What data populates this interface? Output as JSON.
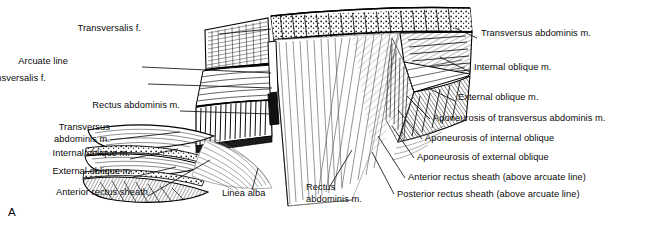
{
  "figure": {
    "panel_letter": "A",
    "background": "#ffffff",
    "ink": "#000000",
    "labels_left": [
      {
        "id": "transversalis-f-top",
        "text": "Transversalis f.",
        "x": 141,
        "y": 29,
        "align": "right",
        "leader": [
          [
            219,
            34
          ],
          [
            271,
            29
          ]
        ]
      },
      {
        "id": "arcuate-line",
        "text": "Arcuate line",
        "x": 68,
        "y": 62,
        "align": "right",
        "leader": [
          [
            142,
            67
          ],
          [
            271,
            73
          ]
        ]
      },
      {
        "id": "transversalis-f-mid",
        "text": "Transversalis f.",
        "x": 46,
        "y": 79,
        "align": "right",
        "leader": [
          [
            148,
            84
          ],
          [
            272,
            88
          ]
        ]
      },
      {
        "id": "rectus-abdominis-m-left",
        "text": "Rectus abdominis m.",
        "x": 46,
        "y": 106,
        "align": "right",
        "leader": [
          [
            180,
            111
          ],
          [
            272,
            114
          ]
        ]
      },
      {
        "id": "transversus-abdominis-m-left",
        "text": "Transversus\nabdominis m.",
        "x": 22,
        "y": 128,
        "align": "right",
        "leader": [
          [
            110,
            140
          ],
          [
            180,
            132
          ]
        ]
      },
      {
        "id": "internal-oblique-m-left",
        "text": "Internal oblique m.",
        "x": 22,
        "y": 154,
        "align": "right",
        "leader": [
          [
            130,
            159
          ],
          [
            178,
            149
          ]
        ]
      },
      {
        "id": "external-oblique-m-left",
        "text": "External oblique m.",
        "x": 22,
        "y": 172,
        "align": "right",
        "leader": [
          [
            133,
            177
          ],
          [
            176,
            167
          ]
        ]
      },
      {
        "id": "anterior-rectus-sheath-left",
        "text": "Anterior rectus sheath",
        "x": 22,
        "y": 193,
        "align": "right",
        "leader": [
          [
            148,
            196
          ],
          [
            210,
            160
          ]
        ]
      }
    ],
    "labels_center": [
      {
        "id": "linea-alba",
        "text": "Linea alba",
        "x": 225,
        "y": 194,
        "align": "left",
        "leader": [
          [
            252,
            190
          ],
          [
            258,
            168
          ]
        ]
      },
      {
        "id": "rectus-abdominis-m-center",
        "text": "Rectus\nabdominis m.",
        "x": 308,
        "y": 188,
        "align": "left",
        "leader": [
          [
            330,
            186
          ],
          [
            352,
            150
          ]
        ]
      }
    ],
    "labels_right": [
      {
        "id": "transversus-abdominis-m-right",
        "text": "Transversus abdominis m.",
        "x": 481,
        "y": 34,
        "align": "left",
        "leader": [
          [
            477,
            38
          ],
          [
            455,
            28
          ]
        ]
      },
      {
        "id": "internal-oblique-m-right",
        "text": "Internal oblique m.",
        "x": 474,
        "y": 68,
        "align": "left",
        "leader": [
          [
            470,
            72
          ],
          [
            440,
            57
          ]
        ]
      },
      {
        "id": "external-oblique-m-right",
        "text": "External oblique m.",
        "x": 458,
        "y": 98,
        "align": "left",
        "leader": [
          [
            455,
            101
          ],
          [
            428,
            88
          ]
        ]
      },
      {
        "id": "aponeurosis-of-transversus-abdominis-m",
        "text": "Aponeurosis of transversus abdominis m.",
        "x": 433,
        "y": 119,
        "align": "left",
        "leader": [
          [
            430,
            119
          ],
          [
            407,
            96
          ]
        ]
      },
      {
        "id": "aponeurosis-of-internal-oblique",
        "text": "Aponeurosis of internal oblique",
        "x": 425,
        "y": 139,
        "align": "left",
        "leader": [
          [
            422,
            139
          ],
          [
            398,
            110
          ]
        ]
      },
      {
        "id": "aponeurosis-of-external-oblique",
        "text": "Aponeurosis of external oblique",
        "x": 417,
        "y": 158,
        "align": "left",
        "leader": [
          [
            414,
            158
          ],
          [
            392,
            126
          ]
        ]
      },
      {
        "id": "anterior-rectus-sheath-above-arcuate-line",
        "text": "Anterior rectus sheath (above arcuate line)",
        "x": 408,
        "y": 178,
        "align": "left",
        "leader": [
          [
            405,
            178
          ],
          [
            378,
            136
          ]
        ]
      },
      {
        "id": "posterior-rectus-sheath-above-arcuate-line",
        "text": "Posterior rectus sheath (above arcuate line)",
        "x": 397,
        "y": 195,
        "align": "left",
        "leader": [
          [
            394,
            194
          ],
          [
            372,
            152
          ]
        ]
      }
    ]
  }
}
